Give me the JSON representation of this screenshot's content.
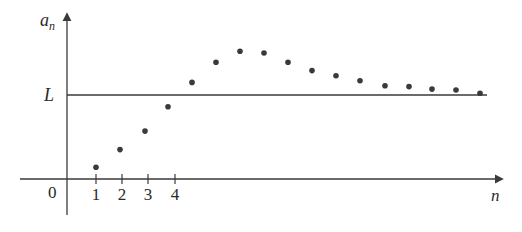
{
  "chart_data": {
    "type": "scatter",
    "title": "",
    "xlabel": "n",
    "ylabel": "a_n",
    "ylabel_main": "a",
    "ylabel_sub": "n",
    "origin_label": "0",
    "x_tick_labels": [
      "1",
      "2",
      "3",
      "4"
    ],
    "x_ticks": [
      1,
      2,
      3,
      4
    ],
    "limit_label": "L",
    "limit_value": 1.0,
    "grid": false,
    "legend": "none",
    "xlim": [
      -2,
      17.5
    ],
    "ylim": [
      -0.4,
      1.9
    ],
    "series": [
      {
        "name": "a_n",
        "x": [
          1,
          2,
          3,
          4,
          5,
          6,
          7,
          8,
          9,
          10,
          11,
          12,
          13,
          14,
          15,
          16,
          17
        ],
        "values": [
          0.14,
          0.35,
          0.57,
          0.86,
          1.15,
          1.39,
          1.52,
          1.5,
          1.39,
          1.29,
          1.23,
          1.17,
          1.11,
          1.1,
          1.07,
          1.06,
          1.02
        ]
      }
    ],
    "annotations": [
      "Horizontal line y = L (limit of sequence)"
    ]
  },
  "colors": {
    "axis": "#3a3a3a",
    "point": "#3a3a3a",
    "text": "#2a2a2a",
    "background": "#ffffff"
  }
}
